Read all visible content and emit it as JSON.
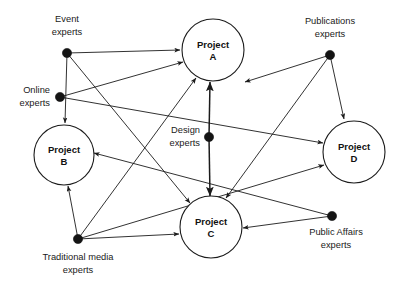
{
  "diagram": {
    "type": "directed-node-link-graph",
    "background_color": "#ffffff",
    "line_color": "#1b1b1b",
    "node_fill_color": "#141414",
    "circle_fill_color": "#ffffff",
    "width": 403,
    "height": 290
  },
  "projects": [
    {
      "id": "A",
      "label_line1": "Project",
      "label_line2": "A",
      "cx": 213,
      "cy": 50,
      "r": 31
    },
    {
      "id": "B",
      "label_line1": "Project",
      "label_line2": "B",
      "cx": 64,
      "cy": 155,
      "r": 30
    },
    {
      "id": "C",
      "label_line1": "Project",
      "label_line2": "C",
      "cx": 211,
      "cy": 227,
      "r": 31
    },
    {
      "id": "D",
      "label_line1": "Project",
      "label_line2": "D",
      "cx": 354,
      "cy": 152,
      "r": 31
    }
  ],
  "actors": [
    {
      "id": "event",
      "label_line1": "Event",
      "label_line2": "experts",
      "x": 67,
      "y": 53,
      "label_x": 67,
      "label_y1": 20,
      "label_y2": 33
    },
    {
      "id": "online",
      "label_line1": "Online",
      "label_line2": "experts",
      "x": 60,
      "y": 97,
      "label_x": 50,
      "label_y1": 91,
      "label_y2": 104
    },
    {
      "id": "publications",
      "label_line1": "Publications",
      "label_line2": "experts",
      "x": 330,
      "y": 55,
      "label_x": 330,
      "label_y1": 22,
      "label_y2": 35
    },
    {
      "id": "design",
      "label_line1": "Design",
      "label_line2": "experts",
      "x": 209,
      "y": 137,
      "label_x": 200,
      "label_y1": 131,
      "label_y2": 144
    },
    {
      "id": "public_affairs",
      "label_line1": "Public Affairs",
      "label_line2": "experts",
      "x": 332,
      "y": 216,
      "label_x": 336,
      "label_y1": 233,
      "label_y2": 246
    },
    {
      "id": "traditional",
      "label_line1": "Traditional media",
      "label_line2": "experts",
      "x": 78,
      "y": 239,
      "label_x": 78,
      "label_y1": 258,
      "label_y2": 271
    }
  ],
  "edges": [
    {
      "from": "event",
      "to": "A",
      "x1": 67,
      "y1": 53,
      "x2": 180,
      "y2": 50
    },
    {
      "from": "event",
      "to": "B",
      "x1": 67,
      "y1": 53,
      "x2": 65,
      "y2": 123
    },
    {
      "from": "event",
      "to": "C",
      "x1": 67,
      "y1": 53,
      "x2": 190,
      "y2": 203
    },
    {
      "from": "online",
      "to": "A",
      "x1": 60,
      "y1": 97,
      "x2": 183,
      "y2": 62
    },
    {
      "from": "online",
      "to": "D",
      "x1": 60,
      "y1": 97,
      "x2": 323,
      "y2": 143
    },
    {
      "from": "design",
      "to": "A",
      "x1": 209,
      "y1": 137,
      "x2": 210,
      "y2": 82
    },
    {
      "from": "design",
      "to": "C",
      "x1": 209,
      "y1": 137,
      "x2": 210,
      "y2": 196
    },
    {
      "from": "publications",
      "to": "A",
      "x1": 330,
      "y1": 55,
      "x2": 245,
      "y2": 82
    },
    {
      "from": "publications",
      "to": "D",
      "x1": 330,
      "y1": 55,
      "x2": 344,
      "y2": 119
    },
    {
      "from": "publications",
      "to": "C",
      "x1": 330,
      "y1": 55,
      "x2": 226,
      "y2": 198
    },
    {
      "from": "public_affairs",
      "to": "C",
      "x1": 332,
      "y1": 216,
      "x2": 243,
      "y2": 228
    },
    {
      "from": "public_affairs",
      "to": "B",
      "x1": 332,
      "y1": 216,
      "x2": 94,
      "y2": 153
    },
    {
      "from": "traditional",
      "to": "B",
      "x1": 78,
      "y1": 239,
      "x2": 68,
      "y2": 186
    },
    {
      "from": "traditional",
      "to": "A",
      "x1": 78,
      "y1": 239,
      "x2": 196,
      "y2": 78
    },
    {
      "from": "traditional",
      "to": "C",
      "x1": 78,
      "y1": 239,
      "x2": 179,
      "y2": 234
    },
    {
      "from": "traditional",
      "to": "D",
      "x1": 78,
      "y1": 239,
      "x2": 324,
      "y2": 165
    }
  ]
}
